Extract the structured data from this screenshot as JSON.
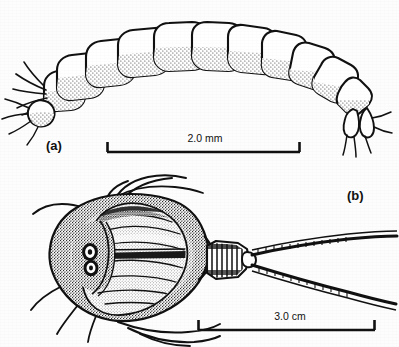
{
  "figure": {
    "background_color": "#fdfdfd",
    "ink_color": "#111111",
    "panels": [
      {
        "id": "a",
        "label": "(a)",
        "subject": "segmented insect larva, lateral view",
        "scale_bar": {
          "label": "2.0 mm",
          "value": 2.0,
          "unit": "mm",
          "x_start": 107,
          "x_end": 300,
          "y": 152
        }
      },
      {
        "id": "b",
        "label": "(b)",
        "subject": "tadpole shrimp, dorsal view",
        "scale_bar": {
          "label": "3.0 cm",
          "value": 3.0,
          "unit": "cm",
          "x_start": 198,
          "x_end": 375,
          "y": 330
        }
      }
    ]
  },
  "labels": {
    "panel_a": "(a)",
    "panel_b": "(b)",
    "scale_a": "2.0 mm",
    "scale_b": "3.0 cm"
  },
  "icons": {
    "larva": "larva-drawing",
    "tadpole_shrimp": "tadpole-shrimp-drawing",
    "scale_bar": "scale-bar-icon"
  }
}
